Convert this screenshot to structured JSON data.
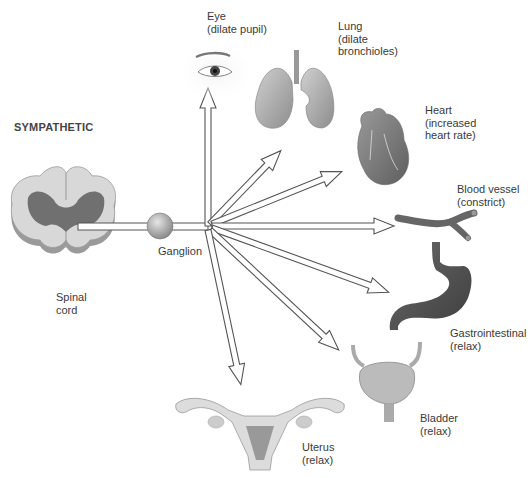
{
  "title": "SYMPATHETIC",
  "source": {
    "name": "Spinal cord",
    "label": "Spinal\ncord"
  },
  "ganglion": {
    "label": "Ganglion"
  },
  "targets": [
    {
      "id": "eye",
      "label": "Eye\n(dilate pupil)"
    },
    {
      "id": "lung",
      "label": "Lung\n(dilate\nbronchioles)"
    },
    {
      "id": "heart",
      "label": "Heart\n(increased\nheart rate)"
    },
    {
      "id": "blood-vessel",
      "label": "Blood vessel\n(constrict)"
    },
    {
      "id": "gastrointestinal",
      "label": "Gastrointestinal\n(relax)"
    },
    {
      "id": "bladder",
      "label": "Bladder\n(relax)"
    },
    {
      "id": "uterus",
      "label": "Uterus\n(relax)"
    }
  ],
  "colors": {
    "arrow_fill": "#ffffff",
    "arrow_stroke": "#555555",
    "organ_gray": "#8a8a8a"
  }
}
